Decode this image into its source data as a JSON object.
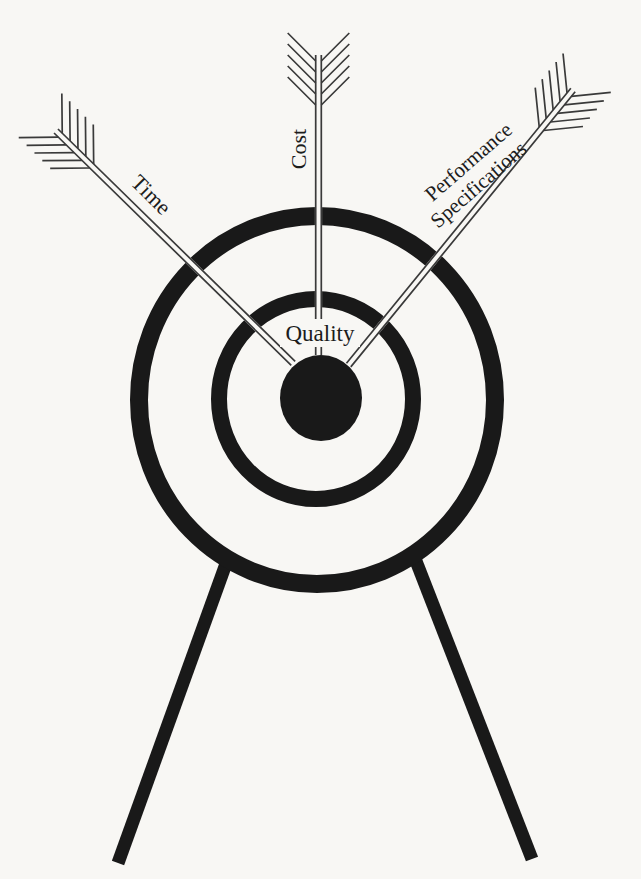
{
  "figure": {
    "alt": "Archery target on a two-legged stand hit in the bullseye by three arrows",
    "colors": {
      "paper": "#f8f7f4",
      "ink": "#191919",
      "arrow_ink": "#3a3a3a",
      "text_ink": "#1c1c1c"
    },
    "labels": {
      "time": "Time",
      "cost": "Cost",
      "performance_line1": "Performance",
      "performance_line2": "Specifications",
      "center": "Quality"
    },
    "structure": {
      "rings": 2,
      "bullseye": true,
      "stand_legs": 2,
      "arrows": 3
    }
  }
}
